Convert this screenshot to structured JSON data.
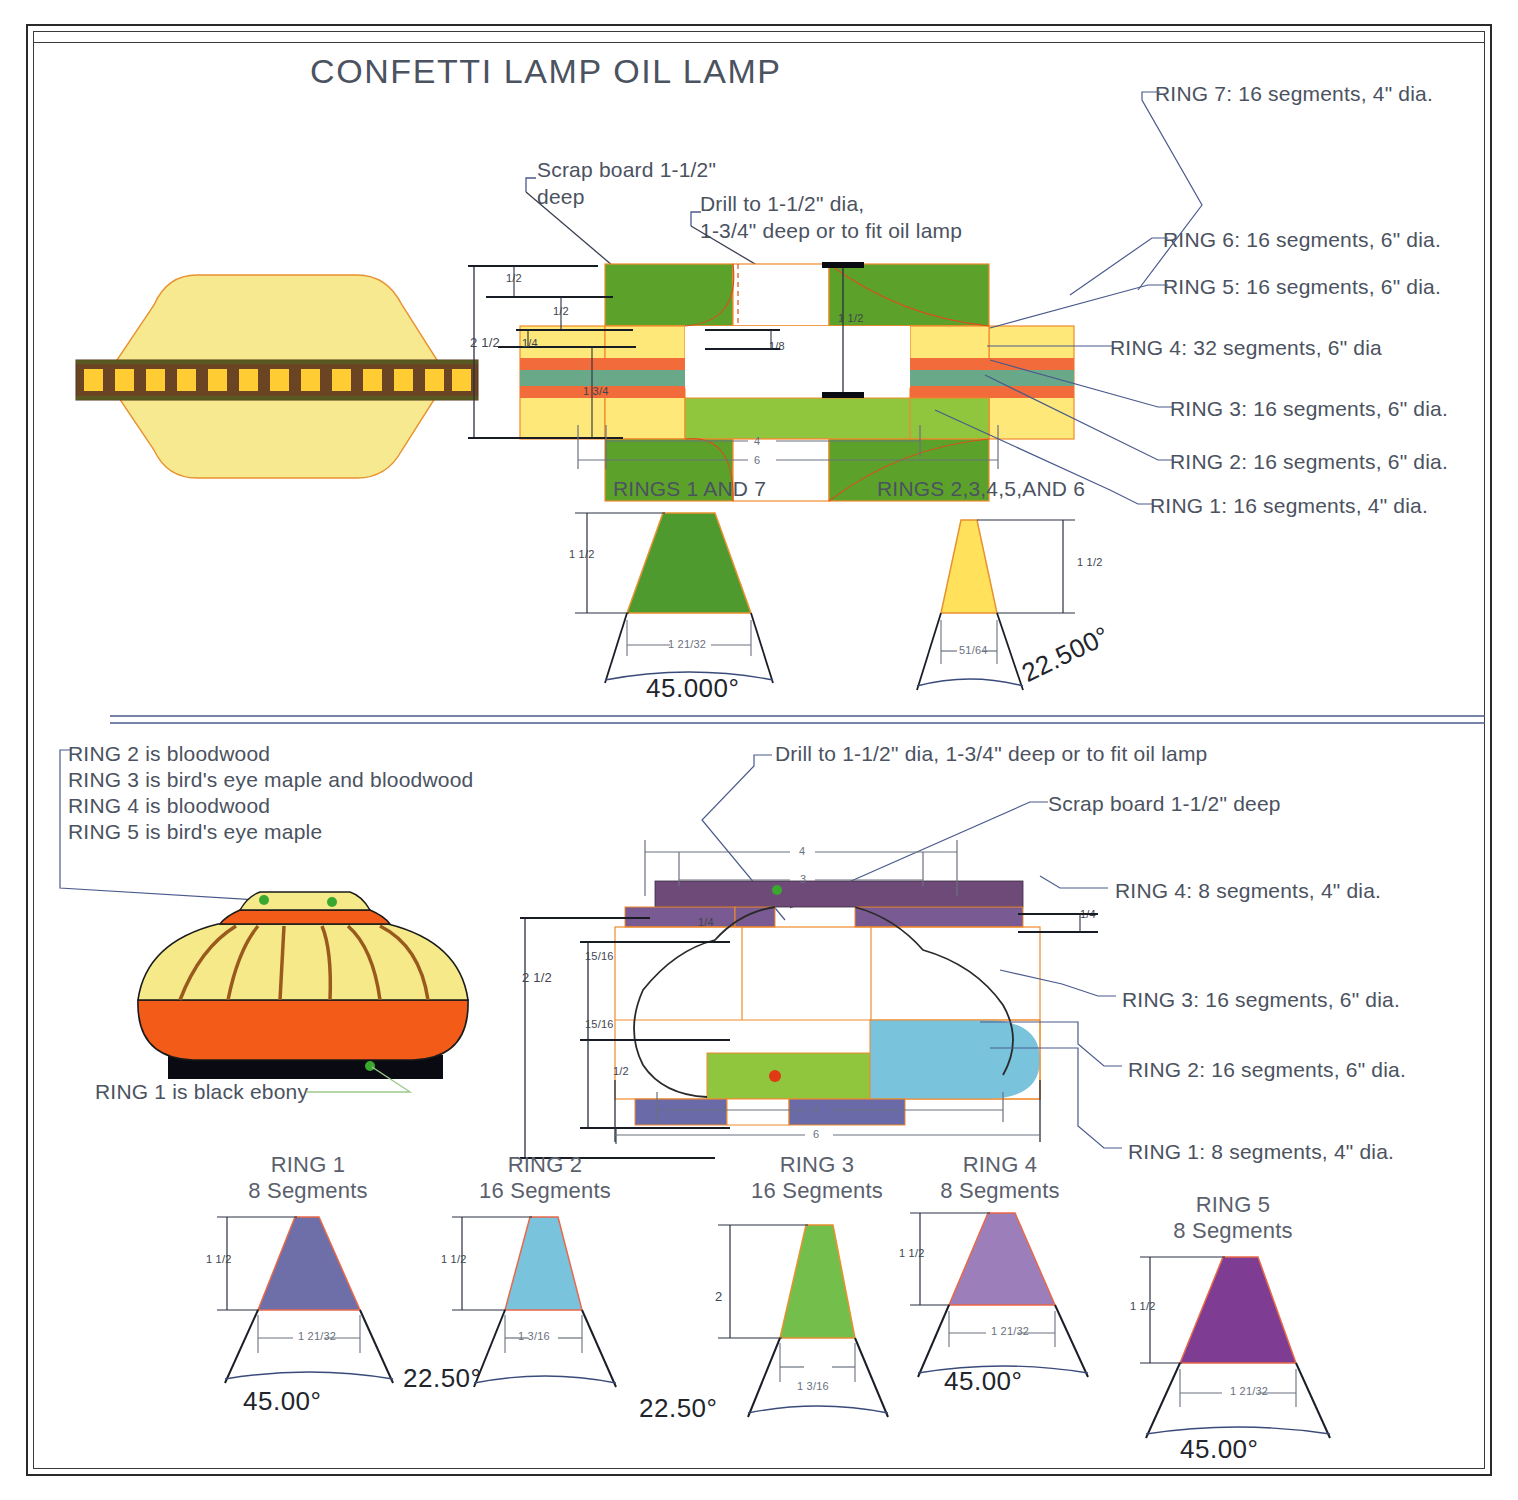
{
  "document": {
    "title": "CONFETTI LAMP OIL LAMP"
  },
  "top_section": {
    "notes": {
      "scrap_board_line1": "Scrap board 1-1/2\"",
      "scrap_board_line2": "deep",
      "drill_line1": "Drill to 1-1/2\" dia,",
      "drill_line2": "1-3/4\" deep or to fit oil lamp"
    },
    "ring_callouts": [
      {
        "label": "RING 7: 16 segments, 4\" dia."
      },
      {
        "label": "RING 6: 16 segments, 6\" dia."
      },
      {
        "label": "RING 5: 16 segments, 6\" dia."
      },
      {
        "label": "RING 4: 32 segments, 6\" dia"
      },
      {
        "label": "RING 3: 16 segments, 6\" dia."
      },
      {
        "label": "RING 2: 16 segments, 6\" dia."
      },
      {
        "label": "RING 1: 16 segments, 4\" dia."
      }
    ],
    "dimensions": {
      "total_height": "2 1/2",
      "d1": "1/2",
      "d2": "1/2",
      "d3": "1/4",
      "d4": "1 3/4",
      "d5": "1/8",
      "d6": "1 1/2",
      "width_inner": "4",
      "width_outer": "6"
    },
    "segment_figures": [
      {
        "caption": "RINGS 1 AND 7",
        "height": "1 1/2",
        "width": "1 21/32",
        "angle": "45.000°",
        "fill": "#4f9a2e"
      },
      {
        "caption": "RINGS 2,3,4,5,AND 6",
        "height": "1 1/2",
        "width": "51/64",
        "angle": "22.500°",
        "fill": "#ffe15c"
      }
    ]
  },
  "bottom_section": {
    "material_notes": [
      "RING 2 is bloodwood",
      "RING 3 is bird's eye maple and bloodwood",
      "RING 4 is bloodwood",
      "RING 5 is bird's eye maple"
    ],
    "ebony_note": "RING 1 is black ebony",
    "notes": {
      "drill": "Drill to 1-1/2\" dia, 1-3/4\" deep or to fit oil lamp",
      "scrap_board": "Scrap board 1-1/2\" deep"
    },
    "ring_callouts": [
      {
        "label": "RING 4: 8 segments, 4\" dia."
      },
      {
        "label": "RING 3: 16 segments, 6\" dia."
      },
      {
        "label": "RING 2: 16 segments, 6\" dia."
      },
      {
        "label": "RING 1: 8 segments, 4\" dia."
      }
    ],
    "dimensions": {
      "total_height": "2 1/2",
      "upper": "15/16",
      "lower": "15/16",
      "base": "1/2",
      "top_small": "1/4",
      "width_3": "3",
      "width_4_top": "4",
      "width_inner": "4",
      "width_outer": "6",
      "right_small": "1/4"
    },
    "segment_figures": [
      {
        "name": "RING 1",
        "segments": "8 Segments",
        "height": "1 1/2",
        "width": "1 21/32",
        "angle": "45.00°",
        "fill": "#6e6fa8"
      },
      {
        "name": "RING 2",
        "segments": "16 Segments",
        "height": "1 1/2",
        "width": "1 3/16",
        "angle": "22.50°",
        "fill": "#79c3dd"
      },
      {
        "name": "RING 3",
        "segments": "16 Segments",
        "height": "2",
        "width": "1 3/16",
        "angle": "22.50°",
        "fill": "#74bf4b"
      },
      {
        "name": "RING 4",
        "segments": "8 Segments",
        "height": "1 1/2",
        "width": "1 21/32",
        "angle": "45.00°",
        "fill": "#9c7fba"
      },
      {
        "name": "RING 5",
        "segments": "8 Segments",
        "height": "1 1/2",
        "width": "1 21/32",
        "angle": "45.00°",
        "fill": "#7e3c93"
      }
    ]
  },
  "colors": {
    "leader_blue": "#4a5a8c",
    "outline_orange": "#f08a2c",
    "green_dark": "#5ca22a",
    "green_light": "#8fc63d",
    "yellow": "#ffe87a",
    "orange_hatch": "#f26b3a",
    "teal": "#6aa88a",
    "purple_dark": "#6e4a78",
    "purple_mid": "#7a5a92",
    "blue_gray": "#6a6aa8",
    "black": "#0a0a12",
    "lamp_yellow": "#f5e98a",
    "lamp_orange": "#f25c18",
    "lamp_brown": "#9a5a1e",
    "confetti_band": "#6b4423",
    "confetti_sq": "#ffcc33"
  }
}
